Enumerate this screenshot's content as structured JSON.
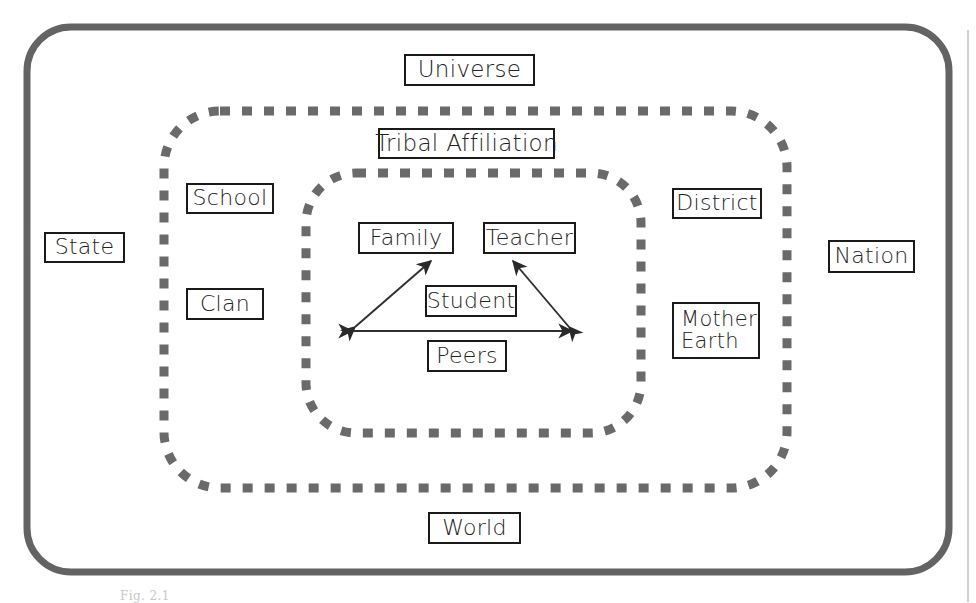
{
  "figure": {
    "type": "nested-ecological-systems-diagram",
    "caption": "Fig. 2.1",
    "colors": {
      "outer_border": "#5f5f5f",
      "dashed_ring": "#666666",
      "box_border": "#1a1a1a",
      "text": "#222222",
      "page_edge_line": "#bdbdbd",
      "background": "#ffffff"
    },
    "rings": [
      {
        "name": "outer-solid-ring",
        "style": "solid",
        "label_boxes": [
          "Universe",
          "State",
          "Nation",
          "World"
        ]
      },
      {
        "name": "middle-dashed-ring",
        "style": "dashed",
        "label_boxes": [
          "Tribal Affiliation",
          "School",
          "Clan",
          "District",
          "Mother Earth"
        ]
      },
      {
        "name": "inner-dashed-ring",
        "style": "dashed",
        "label_boxes": [
          "Family",
          "Teacher",
          "Student",
          "Peers"
        ]
      }
    ],
    "arrows": [
      {
        "from": "Student-left-vertex",
        "to": "Family",
        "double_headed": true
      },
      {
        "from": "Student-right-vertex",
        "to": "Teacher",
        "double_headed": true
      },
      {
        "from": "left-vertex",
        "to": "right-vertex",
        "double_headed": true,
        "passes": "Peers"
      }
    ]
  },
  "boxes": {
    "universe": "Universe",
    "tribal_affiliation": "Tribal Affiliation",
    "school": "School",
    "state": "State",
    "clan": "Clan",
    "family": "Family",
    "teacher": "Teacher",
    "student": "Student",
    "peers": "Peers",
    "district": "District",
    "mother_earth_line1": "Mother",
    "mother_earth_line2": "Earth",
    "nation": "Nation",
    "world": "World"
  }
}
